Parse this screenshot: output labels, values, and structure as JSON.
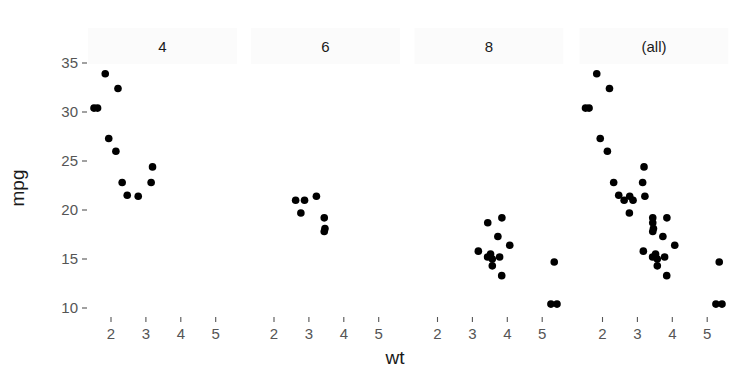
{
  "chart_data": {
    "type": "scatter",
    "title": "",
    "xlabel": "wt",
    "ylabel": "mpg",
    "facet_variable": "cyl",
    "panels": [
      {
        "label": "4",
        "points": [
          {
            "x": 2.32,
            "y": 22.8
          },
          {
            "x": 3.19,
            "y": 24.4
          },
          {
            "x": 3.15,
            "y": 22.8
          },
          {
            "x": 2.2,
            "y": 32.4
          },
          {
            "x": 1.615,
            "y": 30.4
          },
          {
            "x": 1.835,
            "y": 33.9
          },
          {
            "x": 2.465,
            "y": 21.5
          },
          {
            "x": 1.935,
            "y": 27.3
          },
          {
            "x": 2.14,
            "y": 26.0
          },
          {
            "x": 1.513,
            "y": 30.4
          },
          {
            "x": 2.78,
            "y": 21.4
          }
        ]
      },
      {
        "label": "6",
        "points": [
          {
            "x": 2.62,
            "y": 21.0
          },
          {
            "x": 2.875,
            "y": 21.0
          },
          {
            "x": 3.215,
            "y": 21.4
          },
          {
            "x": 3.46,
            "y": 18.1
          },
          {
            "x": 3.44,
            "y": 19.2
          },
          {
            "x": 3.44,
            "y": 17.8
          },
          {
            "x": 2.77,
            "y": 19.7
          }
        ]
      },
      {
        "label": "8",
        "points": [
          {
            "x": 3.44,
            "y": 18.7
          },
          {
            "x": 3.57,
            "y": 14.3
          },
          {
            "x": 4.07,
            "y": 16.4
          },
          {
            "x": 3.73,
            "y": 17.3
          },
          {
            "x": 3.78,
            "y": 15.2
          },
          {
            "x": 5.25,
            "y": 10.4
          },
          {
            "x": 5.424,
            "y": 10.4
          },
          {
            "x": 5.345,
            "y": 14.7
          },
          {
            "x": 3.52,
            "y": 15.5
          },
          {
            "x": 3.435,
            "y": 15.2
          },
          {
            "x": 3.84,
            "y": 13.3
          },
          {
            "x": 3.845,
            "y": 19.2
          },
          {
            "x": 3.17,
            "y": 15.8
          },
          {
            "x": 3.57,
            "y": 15.0
          }
        ]
      },
      {
        "label": "(all)",
        "points": "union of all panels above"
      }
    ],
    "x_ticks": [
      2,
      3,
      4,
      5
    ],
    "y_ticks": [
      10,
      15,
      20,
      25,
      30,
      35
    ],
    "xlim": [
      1.4,
      5.55
    ],
    "ylim": [
      9.5,
      35.5
    ],
    "grid": false,
    "legend": null
  },
  "labels": {
    "xlabel": "wt",
    "ylabel": "mpg",
    "strips": [
      "4",
      "6",
      "8",
      "(all)"
    ]
  }
}
